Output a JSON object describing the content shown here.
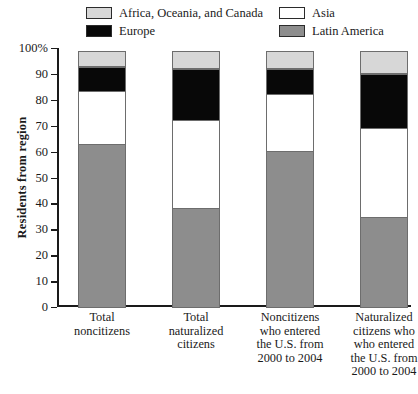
{
  "chart_data": {
    "type": "bar",
    "stacked": true,
    "title": "",
    "xlabel": "",
    "ylabel": "Residents from region",
    "ylim": [
      0,
      100
    ],
    "yticks": [
      "0",
      "10",
      "20",
      "30",
      "40",
      "50",
      "60",
      "70",
      "80",
      "90",
      "100%"
    ],
    "ytick_values": [
      0,
      10,
      20,
      30,
      40,
      50,
      60,
      70,
      80,
      90,
      100
    ],
    "grid": false,
    "legend_position": "top",
    "categories": [
      "Total noncitizens",
      "Total naturalized citizens",
      "Noncitizens who entered the U.S. from 2000 to 2004",
      "Naturalized citizens who who entered the U.S. from 2000 to 2004"
    ],
    "category_lines": [
      [
        "Total",
        "noncitizens"
      ],
      [
        "Total",
        "naturalized",
        "citizens"
      ],
      [
        "Noncitizens",
        "who entered",
        "the U.S. from",
        "2000 to 2004"
      ],
      [
        "Naturalized",
        "citizens who",
        "who entered",
        "the U.S. from",
        "2000 to 2004"
      ]
    ],
    "series": [
      {
        "name": "Latin America",
        "color": "#8d8d8d",
        "values": [
          63.5,
          38.5,
          60.5,
          35.0
        ]
      },
      {
        "name": "Asia",
        "color": "#ffffff",
        "values": [
          20.5,
          34.5,
          22.5,
          35.0
        ]
      },
      {
        "name": "Europe",
        "color": "#080808",
        "values": [
          10.0,
          20.0,
          10.0,
          21.0
        ]
      },
      {
        "name": "Africa, Oceania, and Canada",
        "color": "#d7d7d7",
        "values": [
          6.0,
          7.0,
          7.0,
          9.0
        ]
      }
    ],
    "legend_order": [
      "Africa, Oceania, and Canada",
      "Asia",
      "Europe",
      "Latin America"
    ]
  }
}
